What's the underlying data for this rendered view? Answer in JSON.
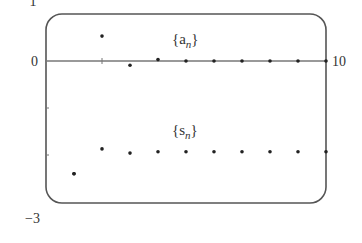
{
  "chart_data": {
    "type": "scatter",
    "title": "",
    "xlabel": "",
    "ylabel": "",
    "xlim": [
      0,
      10
    ],
    "ylim": [
      -3,
      1
    ],
    "x_tick_labels": [
      "10"
    ],
    "y_tick_labels": [
      "1",
      "0",
      "-3"
    ],
    "grid": false,
    "legend": "inline annotations",
    "x": [
      1,
      2,
      3,
      4,
      5,
      6,
      7,
      8,
      9,
      10
    ],
    "series": [
      {
        "name": "{a_n}",
        "label_main": "{a",
        "label_sub": "n",
        "label_close": "}",
        "values": [
          -2.4,
          0.53,
          -0.09,
          0.03,
          0.0,
          0.0,
          0.0,
          0.0,
          0.0,
          0.0
        ]
      },
      {
        "name": "{s_n}",
        "label_main": "{s",
        "label_sub": "n",
        "label_close": "}",
        "values": [
          -2.4,
          -1.87,
          -1.96,
          -1.93,
          -1.93,
          -1.93,
          -1.93,
          -1.93,
          -1.93,
          -1.93
        ]
      }
    ]
  },
  "axes": {
    "y_top_label": "1",
    "y_zero_label": "0",
    "y_bottom_label": "−3",
    "x_right_label": "10"
  },
  "colors": {
    "frame": "#555555",
    "axis": "#777777",
    "point": "#222222",
    "text": "#333333"
  }
}
